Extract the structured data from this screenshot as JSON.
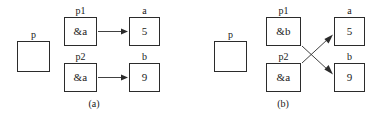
{
  "figure": {
    "panels": [
      {
        "id": "a",
        "caption": "(a)",
        "standalone": {
          "label": "p",
          "value": ""
        },
        "pointers": [
          {
            "label": "p1",
            "value": "&a"
          },
          {
            "label": "p2",
            "value": "&a"
          }
        ],
        "targets": [
          {
            "label": "a",
            "value": "5"
          },
          {
            "label": "b",
            "value": "9"
          }
        ],
        "links": [
          {
            "from": "p1",
            "to": "a",
            "style": "straight"
          },
          {
            "from": "p2",
            "to": "b",
            "style": "straight"
          }
        ]
      },
      {
        "id": "b",
        "caption": "(b)",
        "standalone": {
          "label": "p",
          "value": ""
        },
        "pointers": [
          {
            "label": "p1",
            "value": "&b"
          },
          {
            "label": "p2",
            "value": "&a"
          }
        ],
        "targets": [
          {
            "label": "a",
            "value": "5"
          },
          {
            "label": "b",
            "value": "9"
          }
        ],
        "links": [
          {
            "from": "p1",
            "to": "b",
            "style": "crossed"
          },
          {
            "from": "p2",
            "to": "a",
            "style": "crossed"
          }
        ]
      }
    ],
    "glyphs": {
      "ampersand": "&"
    }
  }
}
